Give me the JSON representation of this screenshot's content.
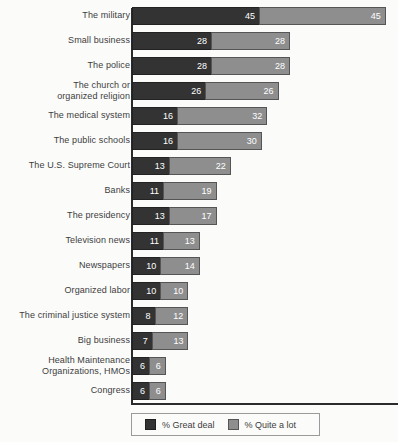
{
  "chart_data": {
    "type": "bar",
    "title": "",
    "subtitle": "",
    "xlabel": "",
    "ylabel": "",
    "orientation": "horizontal",
    "stacked": true,
    "grid": false,
    "legend_position": "bottom",
    "xlim": [
      0,
      100
    ],
    "categories": [
      "The military",
      "Small business",
      "The police",
      "The church or organized religion",
      "The medical system",
      "The public schools",
      "The U.S. Supreme Court",
      "Banks",
      "The presidency",
      "Television news",
      "Newspapers",
      "Organized labor",
      "The criminal justice system",
      "Big business",
      "Health Maintenance Organizations, HMOs",
      "Congress"
    ],
    "series": [
      {
        "name": "% Great deal",
        "color": "#333333",
        "values": [
          45,
          28,
          28,
          26,
          16,
          16,
          13,
          11,
          13,
          11,
          10,
          10,
          8,
          7,
          6,
          6
        ]
      },
      {
        "name": "% Quite a lot",
        "color": "#8e8e8e",
        "values": [
          45,
          28,
          28,
          26,
          32,
          30,
          22,
          19,
          17,
          13,
          14,
          10,
          12,
          13,
          6,
          6
        ]
      }
    ],
    "totals": [
      90,
      56,
      56,
      52,
      48,
      46,
      35,
      30,
      30,
      24,
      24,
      20,
      20,
      20,
      12,
      12
    ]
  },
  "rows": [
    {
      "label_line1": "The military",
      "label_line2": "",
      "great": 45,
      "quite": 45
    },
    {
      "label_line1": "Small business",
      "label_line2": "",
      "great": 28,
      "quite": 28
    },
    {
      "label_line1": "The police",
      "label_line2": "",
      "great": 28,
      "quite": 28
    },
    {
      "label_line1": "The church or",
      "label_line2": "organized religion",
      "great": 26,
      "quite": 26
    },
    {
      "label_line1": "The medical system",
      "label_line2": "",
      "great": 16,
      "quite": 32
    },
    {
      "label_line1": "The public schools",
      "label_line2": "",
      "great": 16,
      "quite": 30
    },
    {
      "label_line1": "The U.S. Supreme Court",
      "label_line2": "",
      "great": 13,
      "quite": 22
    },
    {
      "label_line1": "Banks",
      "label_line2": "",
      "great": 11,
      "quite": 19
    },
    {
      "label_line1": "The presidency",
      "label_line2": "",
      "great": 13,
      "quite": 17
    },
    {
      "label_line1": "Television news",
      "label_line2": "",
      "great": 11,
      "quite": 13
    },
    {
      "label_line1": "Newspapers",
      "label_line2": "",
      "great": 10,
      "quite": 14
    },
    {
      "label_line1": "Organized labor",
      "label_line2": "",
      "great": 10,
      "quite": 10
    },
    {
      "label_line1": "The criminal justice system",
      "label_line2": "",
      "great": 8,
      "quite": 12
    },
    {
      "label_line1": "Big business",
      "label_line2": "",
      "great": 7,
      "quite": 13
    },
    {
      "label_line1": "Health Maintenance",
      "label_line2": "Organizations, HMOs",
      "great": 6,
      "quite": 6
    },
    {
      "label_line1": "Congress",
      "label_line2": "",
      "great": 6,
      "quite": 6
    }
  ],
  "legend": {
    "items": [
      {
        "label": "% Great deal",
        "color": "#333333"
      },
      {
        "label": "% Quite a lot",
        "color": "#8e8e8e"
      }
    ]
  },
  "scale": {
    "px_per_unit": 2.82,
    "origin_x": 132,
    "row_pitch": 25,
    "bar_height": 18
  }
}
